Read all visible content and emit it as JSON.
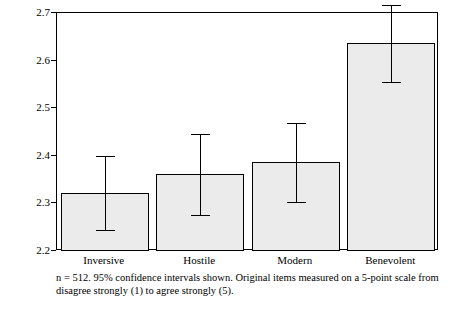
{
  "chart_data": {
    "type": "bar",
    "title": "",
    "xlabel": "",
    "ylabel": "",
    "categories": [
      "Inversive",
      "Hostile",
      "Modern",
      "Benevolent"
    ],
    "values": [
      2.322,
      2.361,
      2.386,
      2.636
    ],
    "error_low": [
      2.245,
      2.275,
      2.303,
      2.556
    ],
    "error_high": [
      2.399,
      2.446,
      2.468,
      2.716
    ],
    "ylim": [
      2.2,
      2.7
    ],
    "yticks": [
      "2.2",
      "2.3",
      "2.4",
      "2.5",
      "2.6",
      "2.7"
    ],
    "ytick_values": [
      2.2,
      2.3,
      2.4,
      2.5,
      2.6,
      2.7
    ],
    "grid": false,
    "legend": "none",
    "bar_fill": "#ebebeb",
    "bar_stroke": "#000000",
    "error_color": "#000000",
    "annotation_line1": "n = 512. 95% confidence intervals shown. Original items measured on a 5-point scale from",
    "annotation_line2": "disagree strongly (1) to agree strongly (5)."
  }
}
